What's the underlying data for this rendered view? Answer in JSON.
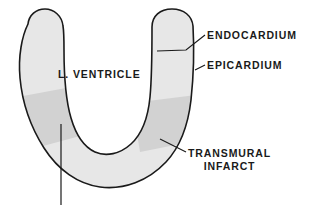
{
  "diagram": {
    "type": "anatomical-cross-section",
    "colors": {
      "background": "#ffffff",
      "myocardium_fill": "#e7e7e7",
      "infarct_fill": "#d2d2d2",
      "outline": "#1a1a1a",
      "text": "#1a1a1a",
      "leader_line": "#1a1a1a"
    },
    "labels": [
      {
        "id": "endocardium",
        "text": "ENDOCARDIUM",
        "target": "inner-wall-surface-right",
        "leader": "line-from-text-left-to-right-wall-inner-edge"
      },
      {
        "id": "epicardium",
        "text": "EPICARDIUM",
        "target": "outer-wall-surface-right",
        "leader": "line-from-text-left-to-right-wall-outer-edge"
      },
      {
        "id": "ventricle",
        "text": "L. VENTRICLE",
        "target": "ventricular-cavity",
        "leader": "none"
      },
      {
        "id": "transmural-infarct",
        "line1": "TRANSMURAL",
        "line2": "INFARCT",
        "target": "right-infarct-band",
        "leader": "line-from-text-left-to-right-infarct-band"
      },
      {
        "id": "left-infarct-pointer",
        "text": "",
        "target": "left-infarct-band",
        "leader": "vertical-line-downward-off-image"
      }
    ],
    "regions": [
      {
        "id": "myocardium-wall",
        "name": "left ventricular wall",
        "shading": "light-gray"
      },
      {
        "id": "ventricular-cavity",
        "name": "ventricular chamber lumen",
        "shading": "white"
      },
      {
        "id": "infarct-left",
        "name": "transmural infarct (left wall)",
        "shading": "medium-gray"
      },
      {
        "id": "infarct-right",
        "name": "transmural infarct (right wall)",
        "shading": "medium-gray"
      }
    ]
  }
}
